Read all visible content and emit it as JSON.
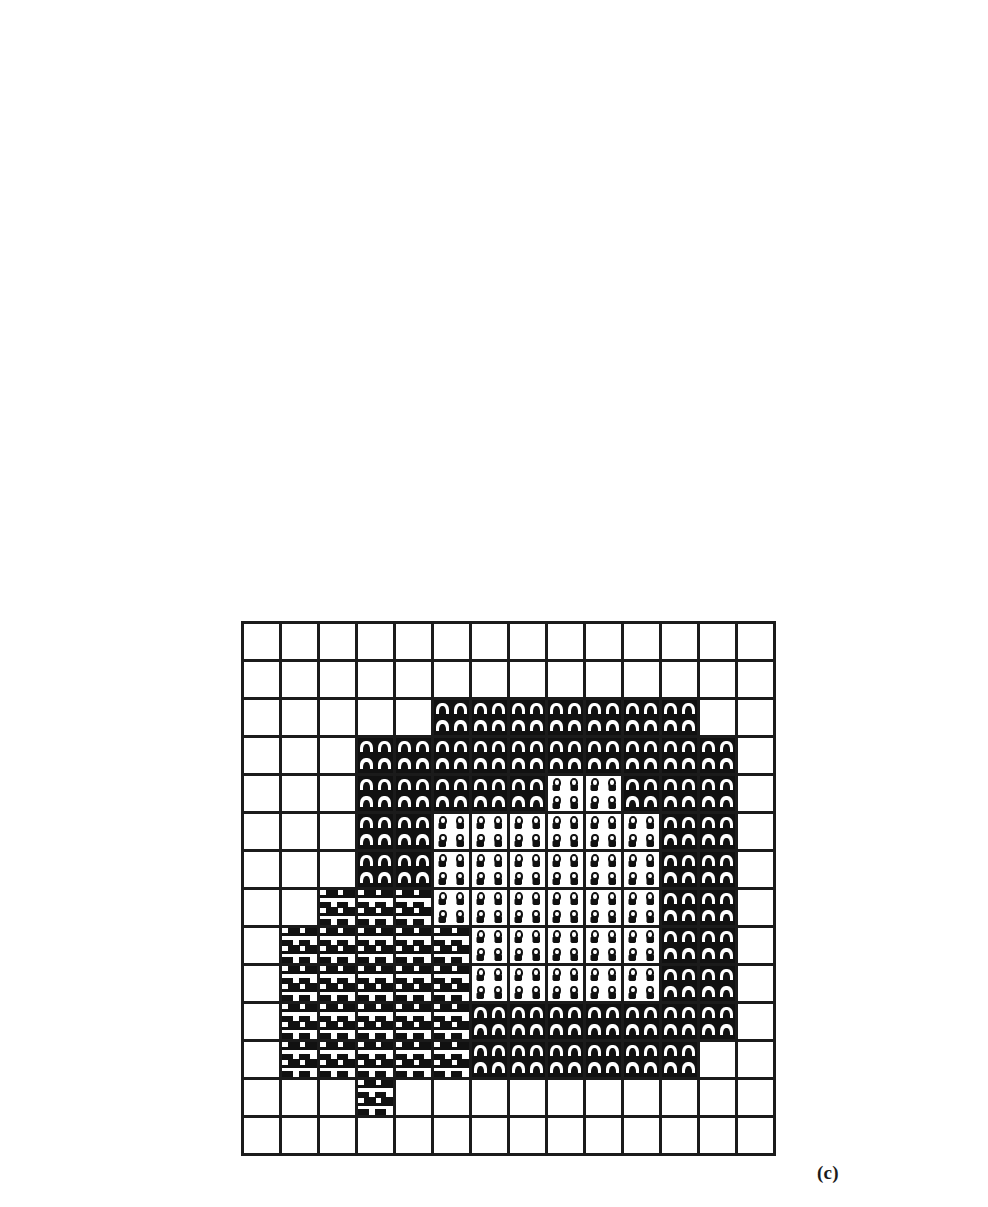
{
  "figure": {
    "title": "",
    "panels": [
      {
        "id": "a",
        "caption": "(a)",
        "caption_x": 305,
        "caption_y": 538,
        "x": 32,
        "y": 217,
        "cell": 40,
        "cols": 6,
        "rows": 8,
        "legend": {
          "empty": "background / unclassified cell",
          "a": "arch-glyph class (region A)",
          "o": "circle-glyph class (region B)",
          "f": "heavy inverse-F glyph class (region C)"
        },
        "cells": [
          [
            "empty",
            "empty",
            "empty",
            "empty",
            "empty",
            "empty"
          ],
          [
            "empty",
            "empty",
            "empty",
            "empty",
            "empty",
            "empty"
          ],
          [
            "empty",
            "empty",
            "a",
            "o",
            "empty",
            "empty"
          ],
          [
            "empty",
            "empty",
            "a",
            "o",
            "empty",
            "empty"
          ],
          [
            "empty",
            "f",
            "a",
            "empty",
            "empty",
            "empty"
          ],
          [
            "empty",
            "f",
            "a",
            "empty",
            "empty",
            "empty"
          ],
          [
            "empty",
            "empty",
            "empty",
            "empty",
            "empty",
            "empty"
          ],
          [
            "empty",
            "empty",
            "empty",
            "empty",
            "empty",
            "empty"
          ]
        ]
      },
      {
        "id": "b",
        "caption": "(b)",
        "caption_x": 930,
        "caption_y": 538,
        "x": 384,
        "y": 26,
        "cell": 41,
        "cols": 12,
        "rows": 12,
        "cells": [
          [
            "empty",
            "empty",
            "empty",
            "empty",
            "empty",
            "empty",
            "empty",
            "empty",
            "empty",
            "empty",
            "empty",
            "empty"
          ],
          [
            "empty",
            "empty",
            "empty",
            "empty",
            "empty",
            "empty",
            "empty",
            "empty",
            "empty",
            "empty",
            "empty",
            "empty"
          ],
          [
            "empty",
            "empty",
            "empty",
            "empty",
            "empty",
            "a",
            "a",
            "a",
            "a",
            "a",
            "a",
            "empty"
          ],
          [
            "empty",
            "empty",
            "empty",
            "empty",
            "a",
            "a",
            "a",
            "a",
            "a",
            "a",
            "a",
            "empty"
          ],
          [
            "empty",
            "empty",
            "empty",
            "empty",
            "a",
            "a",
            "o",
            "o",
            "o",
            "o",
            "a",
            "empty"
          ],
          [
            "empty",
            "empty",
            "empty",
            "empty",
            "a",
            "o",
            "o",
            "o",
            "o",
            "o",
            "a",
            "empty"
          ],
          [
            "empty",
            "empty",
            "empty",
            "f",
            "a",
            "o",
            "o",
            "o",
            "o",
            "o",
            "a",
            "empty"
          ],
          [
            "empty",
            "empty",
            "f",
            "f",
            "f",
            "f",
            "o",
            "o",
            "o",
            "o",
            "a",
            "empty"
          ],
          [
            "empty",
            "f",
            "f",
            "f",
            "f",
            "f",
            "o",
            "o",
            "o",
            "o",
            "a",
            "empty"
          ],
          [
            "empty",
            "f",
            "f",
            "f",
            "f",
            "f",
            "a",
            "a",
            "a",
            "a",
            "a",
            "empty"
          ],
          [
            "empty",
            "empty",
            "f",
            "f",
            "f",
            "f",
            "a",
            "a",
            "a",
            "a",
            "a",
            "empty"
          ],
          [
            "empty",
            "empty",
            "empty",
            "empty",
            "empty",
            "empty",
            "empty",
            "empty",
            "empty",
            "empty",
            "empty",
            "empty"
          ]
        ]
      },
      {
        "id": "c",
        "caption": "(c)",
        "caption_x": 817,
        "caption_y": 1162,
        "x": 241,
        "y": 621,
        "cell": 38,
        "cols": 14,
        "rows": 14,
        "cells": [
          [
            "empty",
            "empty",
            "empty",
            "empty",
            "empty",
            "empty",
            "empty",
            "empty",
            "empty",
            "empty",
            "empty",
            "empty",
            "empty",
            "empty"
          ],
          [
            "empty",
            "empty",
            "empty",
            "empty",
            "empty",
            "empty",
            "empty",
            "empty",
            "empty",
            "empty",
            "empty",
            "empty",
            "empty",
            "empty"
          ],
          [
            "empty",
            "empty",
            "empty",
            "empty",
            "empty",
            "a",
            "a",
            "a",
            "a",
            "a",
            "a",
            "a",
            "empty",
            "empty"
          ],
          [
            "empty",
            "empty",
            "empty",
            "a",
            "a",
            "a",
            "a",
            "a",
            "a",
            "a",
            "a",
            "a",
            "a",
            "empty"
          ],
          [
            "empty",
            "empty",
            "empty",
            "a",
            "a",
            "a",
            "a",
            "a",
            "o",
            "o",
            "a",
            "a",
            "a",
            "empty"
          ],
          [
            "empty",
            "empty",
            "empty",
            "a",
            "a",
            "o",
            "o",
            "o",
            "o",
            "o",
            "o",
            "a",
            "a",
            "empty"
          ],
          [
            "empty",
            "empty",
            "empty",
            "a",
            "a",
            "o",
            "o",
            "o",
            "o",
            "o",
            "o",
            "a",
            "a",
            "empty"
          ],
          [
            "empty",
            "empty",
            "f",
            "f",
            "f",
            "o",
            "o",
            "o",
            "o",
            "o",
            "o",
            "a",
            "a",
            "empty"
          ],
          [
            "empty",
            "f",
            "f",
            "f",
            "f",
            "f",
            "o",
            "o",
            "o",
            "o",
            "o",
            "a",
            "a",
            "empty"
          ],
          [
            "empty",
            "f",
            "f",
            "f",
            "f",
            "f",
            "o",
            "o",
            "o",
            "o",
            "o",
            "a",
            "a",
            "empty"
          ],
          [
            "empty",
            "f",
            "f",
            "f",
            "f",
            "f",
            "a",
            "a",
            "a",
            "a",
            "a",
            "a",
            "a",
            "empty"
          ],
          [
            "empty",
            "f",
            "f",
            "f",
            "f",
            "f",
            "a",
            "a",
            "a",
            "a",
            "a",
            "a",
            "empty",
            "empty"
          ],
          [
            "empty",
            "empty",
            "empty",
            "f",
            "empty",
            "empty",
            "empty",
            "empty",
            "empty",
            "empty",
            "empty",
            "empty",
            "empty",
            "empty"
          ],
          [
            "empty",
            "empty",
            "empty",
            "empty",
            "empty",
            "empty",
            "empty",
            "empty",
            "empty",
            "empty",
            "empty",
            "empty",
            "empty",
            "empty"
          ]
        ]
      }
    ]
  }
}
